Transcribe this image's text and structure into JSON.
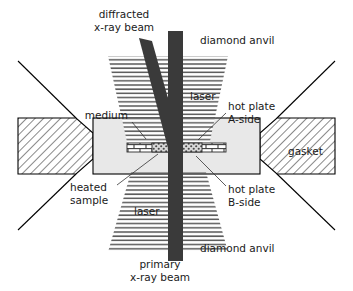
{
  "figure": {
    "background_color": "#ffffff"
  },
  "colors": {
    "beam": "#3a3a3a",
    "medium": "#e8e8e8",
    "gasket_fill": "#ffffff",
    "hatch_stroke": "#4a4a4a",
    "laser_stripe": "#555555",
    "outline": "#000000",
    "text": "#1a1a1a",
    "leader": "#333333"
  },
  "labels": {
    "diffracted_beam": {
      "line1": "diffracted",
      "line2": "x-ray beam"
    },
    "diamond_anvil_top": "diamond anvil",
    "diamond_anvil_bottom": "diamond anvil",
    "primary_beam": {
      "line1": "primary",
      "line2": "x-ray beam"
    },
    "laser_top": "laser",
    "laser_bottom": "laser",
    "medium": "medium",
    "gasket": "gasket",
    "heated_sample": {
      "line1": "heated",
      "line2": "sample"
    },
    "hot_plate_a": {
      "line1": "hot plate",
      "line2": "A-side"
    },
    "hot_plate_b": {
      "line1": "hot plate",
      "line2": "B-side"
    }
  },
  "components": {
    "gasket_left": "gasket-left-hatched-block",
    "gasket_right": "gasket-right-hatched-block",
    "pressure_medium": "pressure-medium-chamber",
    "hot_plate_a_side": "hot-plate-a-side-brick",
    "hot_plate_b_side": "hot-plate-b-side-brick",
    "sample_left": "heated-sample-left-speckle",
    "sample_right": "heated-sample-right-speckle",
    "laser_cone_top": "laser-cone-upper",
    "laser_cone_bottom": "laser-cone-lower",
    "anvil_edge_top_left": "diamond-anvil-edge-top-left",
    "anvil_edge_top_right": "diamond-anvil-edge-top-right",
    "anvil_edge_bottom_left": "diamond-anvil-edge-bottom-left",
    "anvil_edge_bottom_right": "diamond-anvil-edge-bottom-right",
    "primary_x_ray_beam": "primary-x-ray-beam-vertical",
    "diffracted_x_ray_beam": "diffracted-x-ray-beam-diagonal"
  }
}
